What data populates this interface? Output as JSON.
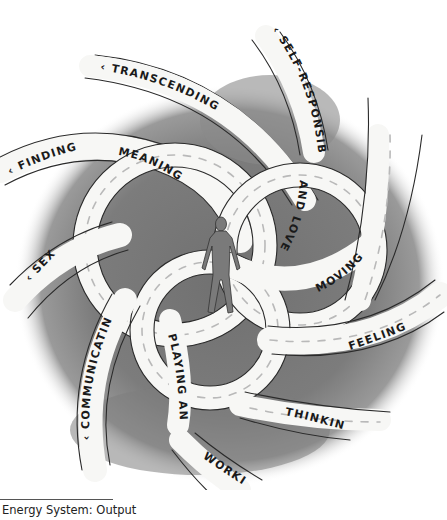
{
  "figure": {
    "caption": "Energy System: Output",
    "center_figure": "human-silhouette",
    "colors": {
      "background": "#ffffff",
      "wash_dark": "#6b6b6b",
      "wash_mid": "#8e8e8e",
      "road_fill": "#f7f7f5",
      "road_outline": "#2a2a2a",
      "road_dash": "#b9b9b9",
      "figure_fill": "#7a7a7a",
      "text": "#1a1a1a"
    },
    "labels": {
      "transcending": "‹ TRANSCENDING",
      "self_responsibility": "‹ SELF-RESPONSIBILITY",
      "finding": "‹ FINDING",
      "meaning": "MEANING",
      "and_love": "AND LOVE",
      "moving": "MOVING ›",
      "sex": "‹ SEX",
      "feeling": "FEELING ›",
      "communicating": "‹ COMMUNICATING",
      "playing_and": "PLAYING AND",
      "thinking": "THINKING ›",
      "working": "WORKING ›"
    }
  }
}
